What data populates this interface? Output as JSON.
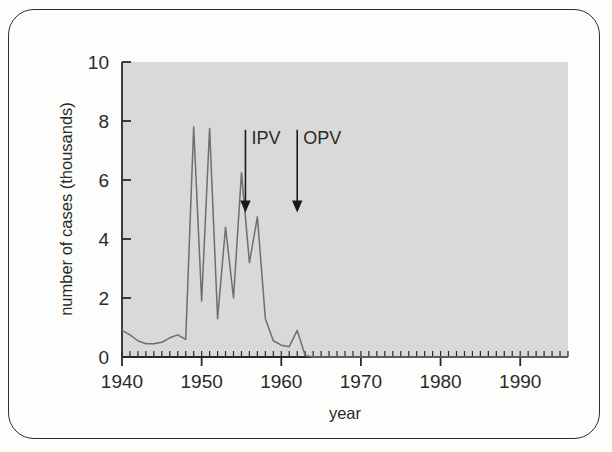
{
  "figure": {
    "title": "",
    "frame_color": "#2b2b2b",
    "background_color": "#fdfdfc",
    "plot_background_color": "#d9d9d9",
    "line_color": "#6e6e6e",
    "axis_color": "#2a2a2a"
  },
  "chart_data": {
    "type": "line",
    "title": "",
    "subtitle": "",
    "xlabel": "year",
    "ylabel": "number of cases (thousands)",
    "xlim": [
      1940,
      1996
    ],
    "ylim": [
      0,
      10
    ],
    "grid": false,
    "legend": null,
    "x_major_ticks": [
      1940,
      1950,
      1960,
      1970,
      1980,
      1990
    ],
    "x_major_tick_labels": [
      "1940",
      "1950",
      "1960",
      "1970",
      "1980",
      "1990"
    ],
    "x_minor_tick_interval": 1,
    "y_major_ticks": [
      0,
      2,
      4,
      6,
      8,
      10
    ],
    "y_major_tick_labels": [
      "0",
      "2",
      "4",
      "6",
      "8",
      "10"
    ],
    "series": [
      {
        "name": "number of cases (thousands)",
        "x": [
          1940,
          1941,
          1942,
          1943,
          1944,
          1945,
          1946,
          1947,
          1948,
          1949,
          1950,
          1951,
          1952,
          1953,
          1954,
          1955,
          1956,
          1957,
          1958,
          1959,
          1960,
          1961,
          1962,
          1963,
          1964,
          1965,
          1966,
          1967,
          1968,
          1969,
          1970,
          1971,
          1972,
          1973,
          1974,
          1975,
          1976,
          1977,
          1978,
          1979,
          1980,
          1981,
          1982,
          1983,
          1984,
          1985,
          1986,
          1987,
          1988,
          1989,
          1990,
          1991,
          1992,
          1993,
          1994,
          1995,
          1996
        ],
        "values": [
          0.9,
          0.75,
          0.55,
          0.45,
          0.45,
          0.5,
          0.65,
          0.75,
          0.6,
          7.8,
          1.9,
          7.75,
          1.3,
          4.4,
          2.0,
          6.25,
          3.2,
          4.75,
          1.3,
          0.55,
          0.4,
          0.35,
          0.9,
          0.05,
          0.0,
          0.0,
          0.0,
          0.0,
          0.0,
          0.0,
          0.0,
          0.0,
          0.0,
          0.0,
          0.0,
          0.0,
          0.0,
          0.0,
          0.0,
          0.0,
          0.0,
          0.0,
          0.0,
          0.0,
          0.0,
          0.0,
          0.0,
          0.0,
          0.0,
          0.0,
          0.0,
          0.0,
          0.0,
          0.0,
          0.0,
          0.0,
          0.0
        ]
      }
    ],
    "annotations": [
      {
        "label": "IPV",
        "x": 1955.5,
        "arrow_y_top": 6.3,
        "arrow_y_bottom": 4.9
      },
      {
        "label": "OPV",
        "x": 1962.0,
        "arrow_y_top": 6.3,
        "arrow_y_bottom": 4.9
      }
    ]
  },
  "axes": {
    "x_title": "year",
    "y_title": "number of cases (thousands)"
  }
}
